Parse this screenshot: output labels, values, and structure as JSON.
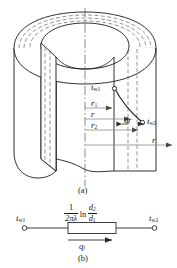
{
  "figure": {
    "type": "technical-diagram",
    "panels": [
      {
        "id": "a",
        "caption": "(a)",
        "description": "cut-away hollow cylinder with radial temperature profile"
      },
      {
        "id": "b",
        "caption": "(b)",
        "description": "equivalent thermal circuit"
      }
    ]
  },
  "panel_a": {
    "caption": "(a)",
    "labels": {
      "t_w1": {
        "base": "t",
        "sub": "w1"
      },
      "t_w2": {
        "base": "t",
        "sub": "w2"
      },
      "r1": {
        "base": "r",
        "sub": "1"
      },
      "r": {
        "base": "r",
        "sub": ""
      },
      "r2": {
        "base": "r",
        "sub": "2"
      },
      "dr": {
        "d": "d",
        "var": "r"
      },
      "r_axis": {
        "base": "r",
        "sub": ""
      }
    },
    "dimension_arrows": [
      "r1",
      "r",
      "r2",
      "r"
    ],
    "element_label": "dr",
    "centerline": "dash-dot axis of revolution"
  },
  "panel_b": {
    "caption": "(b)",
    "left_terminal": {
      "base": "t",
      "sub": "w1"
    },
    "right_terminal": {
      "base": "t",
      "sub": "w2"
    },
    "resistance_formula": {
      "coefficient": {
        "numerator": "1",
        "denominator": "2πλ"
      },
      "operator": "ln",
      "ratio": {
        "numerator": {
          "base": "d",
          "sub": "2"
        },
        "denominator": {
          "base": "d",
          "sub": "1"
        }
      }
    },
    "flow_label": {
      "base": "q",
      "sub": "l"
    },
    "flow_direction": "left-to-right"
  },
  "colors": {
    "line": "#1a1a1a",
    "thin_line": "#6b6b6b",
    "background": "#ffffff",
    "dashed": "#4d4d4d"
  }
}
